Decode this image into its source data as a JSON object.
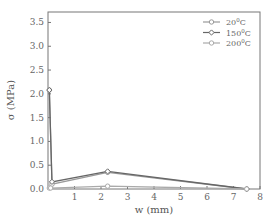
{
  "chart_data": {
    "type": "line",
    "title": "",
    "xlabel": "w (mm)",
    "ylabel": "σ (MPa)",
    "xlim": [
      0,
      8
    ],
    "ylim": [
      0,
      3.72
    ],
    "xticks": [
      1,
      2,
      3,
      4,
      5,
      6,
      7,
      8
    ],
    "yticks": [
      0.0,
      0.5,
      1.0,
      1.5,
      2.0,
      2.5,
      3.0,
      3.5
    ],
    "ytick_labels": [
      "0.0",
      "0.5",
      "1.0",
      "1.5",
      "2.0",
      "2.5",
      "3.0",
      "3.5"
    ],
    "grid": false,
    "legend_position": "upper right",
    "series": [
      {
        "name": "20°C",
        "label_base": "20",
        "color": "#9a9a9a",
        "marker": "circle",
        "x": [
          0.05,
          0.15,
          2.25,
          7.5
        ],
        "y": [
          2.08,
          0.1,
          0.35,
          0.0
        ]
      },
      {
        "name": "150°C",
        "label_base": "150",
        "color": "#666666",
        "marker": "diamond",
        "x": [
          0.05,
          0.15,
          2.25,
          7.5
        ],
        "y": [
          2.08,
          0.15,
          0.37,
          0.0
        ]
      },
      {
        "name": "200°C",
        "label_base": "200",
        "color": "#aaaaaa",
        "marker": "circle",
        "x": [
          0.05,
          0.1,
          2.25,
          7.5
        ],
        "y": [
          0.02,
          0.02,
          0.06,
          0.0
        ]
      }
    ]
  }
}
